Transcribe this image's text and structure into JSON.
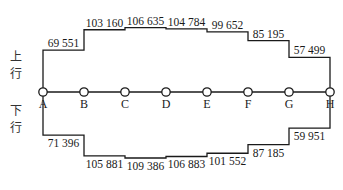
{
  "diagram": {
    "type": "section-passenger-flow",
    "directions": {
      "up": {
        "label_chars": [
          "上",
          "行"
        ],
        "label": "上行"
      },
      "down": {
        "label_chars": [
          "下",
          "行"
        ],
        "label": "下行"
      }
    },
    "stations": [
      "A",
      "B",
      "C",
      "D",
      "E",
      "F",
      "G",
      "H"
    ],
    "up_flows": [
      "69 551",
      "103 160",
      "106 635",
      "104 784",
      "99 652",
      "85 195",
      "57 499"
    ],
    "down_flows": [
      "71 396",
      "105 881",
      "109 386",
      "106 883",
      "101 552",
      "87 185",
      "59 951"
    ],
    "up_values": [
      69551,
      103160,
      106635,
      104784,
      99652,
      85195,
      57499
    ],
    "down_values": [
      71396,
      105881,
      109386,
      106883,
      101552,
      87185,
      59951
    ]
  }
}
